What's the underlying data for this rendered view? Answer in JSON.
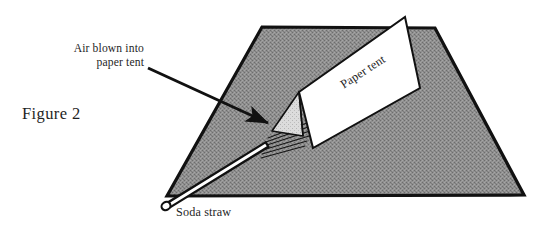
{
  "figure": {
    "caption": "Figure 2",
    "labels": {
      "callout_line1": "Air blown into",
      "callout_line2": "paper tent",
      "paper_tent": "Paper tent",
      "soda_straw": "Soda straw"
    },
    "colors": {
      "ink": "#1a1a1a",
      "table_fill": "#8a8a8a",
      "table_outline": "#111111",
      "tent_face": "#ffffff",
      "tent_end_face": "#d6d6d6",
      "background": "#ffffff",
      "straw_fill": "#ffffff"
    },
    "elements": [
      "table-surface",
      "paper-tent",
      "tent-end-opening",
      "soda-straw",
      "airflow-streaks",
      "callout-arrow"
    ],
    "airflow_streak_count": 6
  }
}
